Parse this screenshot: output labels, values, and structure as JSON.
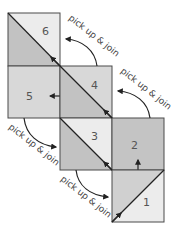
{
  "diagram": {
    "title": "",
    "colors": {
      "outline": "#4a4a4a",
      "dark_fill": "#c2c2c2",
      "light_fill": "#ececec",
      "mid_fill": "#d8d8d8",
      "arrow": "#222222",
      "label_text": "#555555"
    },
    "squares": [
      {
        "number": "1",
        "label": "1",
        "type": "half-square-triangle",
        "x": 112,
        "y": 170
      },
      {
        "number": "2",
        "label": "2",
        "type": "solid",
        "x": 112,
        "y": 118
      },
      {
        "number": "3",
        "label": "3",
        "type": "half-square-triangle",
        "x": 60,
        "y": 118
      },
      {
        "number": "4",
        "label": "4",
        "type": "half-square-triangle",
        "x": 60,
        "y": 66
      },
      {
        "number": "5",
        "label": "5",
        "type": "solid",
        "x": 8,
        "y": 66
      },
      {
        "number": "6",
        "label": "6",
        "type": "half-square-triangle",
        "x": 8,
        "y": 13
      }
    ],
    "instructions": [
      {
        "text": "pick up & join",
        "from": "2",
        "to": "3"
      },
      {
        "text": "pick up & join",
        "from": "3",
        "to": "4"
      },
      {
        "text": "pick up & join",
        "from": "4",
        "to": "5"
      },
      {
        "text": "pick up & join",
        "from": "5",
        "to": "6"
      },
      {
        "text": "pick up & join",
        "from": "1",
        "to": "2"
      }
    ]
  }
}
